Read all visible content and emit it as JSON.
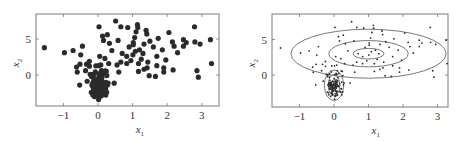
{
  "chart_data": [
    {
      "type": "scatter",
      "title": "",
      "xlabel": "x1",
      "ylabel": "x2",
      "xticks": [
        -1,
        0,
        1,
        2,
        3
      ],
      "yticks": [
        0,
        5
      ],
      "xlim": [
        -1.7,
        3.5
      ],
      "ylim": [
        -4.3,
        8.4
      ],
      "grid": false,
      "legend": null,
      "marker": "large filled circle",
      "series": [
        {
          "name": "broad cluster",
          "points": [
            [
              -1.55,
              3.8
            ],
            [
              -0.97,
              3.1
            ],
            [
              -0.72,
              3.4
            ],
            [
              -0.45,
              4.0
            ],
            [
              -0.5,
              2.8
            ],
            [
              -0.62,
              1.1
            ],
            [
              -0.6,
              0.4
            ],
            [
              -0.53,
              -1.4
            ],
            [
              0.03,
              6.7
            ],
            [
              0.51,
              7.5
            ],
            [
              0.66,
              6.7
            ],
            [
              0.86,
              6.6
            ],
            [
              1.14,
              7.0
            ],
            [
              1.15,
              6.6
            ],
            [
              1.39,
              6.2
            ],
            [
              1.41,
              5.7
            ],
            [
              0.13,
              5.4
            ],
            [
              0.27,
              5.6
            ],
            [
              0.58,
              4.8
            ],
            [
              0.16,
              4.8
            ],
            [
              0.33,
              4.4
            ],
            [
              1.06,
              5.2
            ],
            [
              1.02,
              4.5
            ],
            [
              1.33,
              4.3
            ],
            [
              1.74,
              5.1
            ],
            [
              2.05,
              5.9
            ],
            [
              2.15,
              4.6
            ],
            [
              2.47,
              4.9
            ],
            [
              2.47,
              4.0
            ],
            [
              2.79,
              6.7
            ],
            [
              2.8,
              4.6
            ],
            [
              2.95,
              4.3
            ],
            [
              3.25,
              4.9
            ],
            [
              3.28,
              1.6
            ],
            [
              2.86,
              0.6
            ],
            [
              2.9,
              -0.3
            ],
            [
              2.17,
              0.7
            ],
            [
              1.9,
              0.4
            ],
            [
              1.96,
              2.1
            ],
            [
              1.7,
              2.6
            ],
            [
              1.86,
              3.5
            ],
            [
              1.44,
              1.8
            ],
            [
              1.42,
              1.0
            ],
            [
              1.48,
              -0.1
            ],
            [
              1.33,
              0.8
            ],
            [
              1.17,
              0.5
            ],
            [
              1.01,
              2.8
            ],
            [
              1.08,
              3.3
            ],
            [
              0.83,
              2.6
            ],
            [
              0.83,
              1.6
            ],
            [
              0.66,
              1.8
            ],
            [
              0.55,
              1.4
            ],
            [
              0.6,
              0.4
            ],
            [
              0.31,
              1.6
            ],
            [
              0.05,
              2.6
            ],
            [
              0.08,
              1.4
            ],
            [
              0.24,
              0.5
            ],
            [
              -0.33,
              1.5
            ],
            [
              -0.25,
              1.9
            ],
            [
              -0.36,
              0.6
            ],
            [
              -0.52,
              1.5
            ],
            [
              1.17,
              1.6
            ],
            [
              1.7,
              1.3
            ],
            [
              1.66,
              -0.2
            ],
            [
              1.02,
              4.2
            ],
            [
              1.2,
              3.5
            ],
            [
              1.3,
              3.0
            ],
            [
              0.9,
              3.9
            ],
            [
              1.25,
              2.2
            ],
            [
              2.3,
              3.1
            ],
            [
              2.2,
              4.0
            ],
            [
              1.5,
              4.7
            ],
            [
              0.7,
              3.0
            ],
            [
              0.95,
              2.0
            ],
            [
              1.6,
              3.9
            ],
            [
              2.55,
              4.5
            ],
            [
              1.1,
              6.0
            ],
            [
              0.4,
              3.4
            ],
            [
              0.2,
              2.3
            ],
            [
              1.9,
              1.0
            ]
          ]
        },
        {
          "name": "tight cluster",
          "center": [
            0.0,
            -1.5
          ],
          "spread": [
            0.12,
            1.1
          ],
          "count": 110
        }
      ]
    },
    {
      "type": "scatter",
      "title": "",
      "xlabel": "x1",
      "ylabel": "x2",
      "xticks": [
        -1,
        0,
        1,
        2,
        3
      ],
      "yticks": [
        0,
        5
      ],
      "xlim": [
        -1.8,
        3.3
      ],
      "ylim": [
        -4.5,
        8.4
      ],
      "grid": false,
      "legend": null,
      "marker": "small dot",
      "series": [
        {
          "name": "broad cluster",
          "same_points_as": "left panel broad cluster"
        },
        {
          "name": "tight cluster",
          "same_points_as": "left panel tight cluster"
        }
      ],
      "contours": [
        {
          "component": "broad",
          "center": [
            1.0,
            3.0
          ],
          "radii_x": [
            0.45,
            1.15,
            2.25
          ],
          "radii_y": [
            0.75,
            1.85,
            3.45
          ]
        },
        {
          "component": "tight",
          "center": [
            0.0,
            -1.45
          ],
          "radii_x": [
            0.08,
            0.17,
            0.28
          ],
          "radii_y": [
            0.8,
            1.5,
            2.15
          ]
        }
      ]
    }
  ],
  "labels": {
    "xlabel_main": "x",
    "xlabel_sub": "1",
    "ylabel_main": "x",
    "ylabel_sub": "2",
    "xtick_labels": [
      "−1",
      "0",
      "1",
      "2",
      "3"
    ],
    "ytick_labels": [
      "0",
      "5"
    ]
  },
  "colors": {
    "marker": "#2b2b2b",
    "frame": "#7a7a7a",
    "contour": "#555555",
    "text": "#333333"
  }
}
